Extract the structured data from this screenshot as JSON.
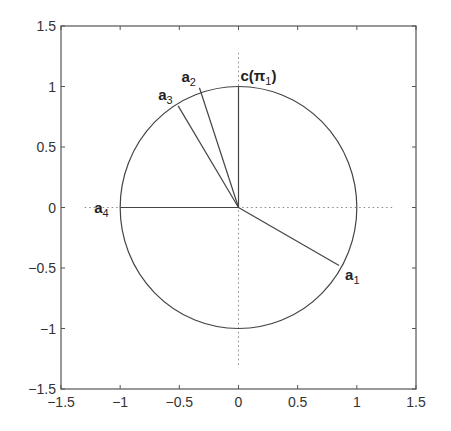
{
  "chart_data": {
    "type": "scatter",
    "title": "",
    "xlabel": "",
    "ylabel": "",
    "xlim": [
      -1.5,
      1.5
    ],
    "ylim": [
      -1.5,
      1.5
    ],
    "grid": false,
    "xticks": [
      "-1.5",
      "-1",
      "-0.5",
      "0",
      "0.5",
      "1",
      "1.5"
    ],
    "yticks": [
      "1.5",
      "1",
      "0.5",
      "0",
      "-0.5",
      "-1",
      "-1.5"
    ],
    "unit_circle": {
      "center": [
        0,
        0
      ],
      "radius": 1
    },
    "dotted_axes": {
      "horizontal": {
        "y": 0,
        "x_from": -1.3,
        "x_to": 1.3
      },
      "vertical": {
        "x": 0,
        "y_from": -1.3,
        "y_to": 1.3
      }
    },
    "vectors": [
      {
        "name": "a1",
        "label": "a",
        "subscript": "1",
        "x": 0.85,
        "y": -0.48
      },
      {
        "name": "a2",
        "label": "a",
        "subscript": "2",
        "x": -0.33,
        "y": 0.99
      },
      {
        "name": "a3",
        "label": "a",
        "subscript": "3",
        "x": -0.51,
        "y": 0.84
      },
      {
        "name": "a4",
        "label": "a",
        "subscript": "4",
        "x": -1.0,
        "y": 0.0
      },
      {
        "name": "c",
        "label": "c(π",
        "subscript": "1",
        "suffix": ")",
        "x": 0.0,
        "y": 1.0
      }
    ]
  },
  "colors": {
    "line": "#444444",
    "axis": "#555555",
    "dotted": "#888888",
    "text": "#222222"
  }
}
